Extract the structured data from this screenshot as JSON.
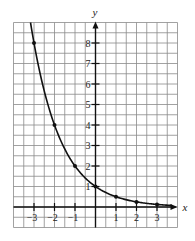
{
  "chart_data": {
    "type": "line",
    "title": "",
    "function": "y = (1/2)^x",
    "xlabel": "x",
    "ylabel": "y",
    "xlim": [
      -4,
      4
    ],
    "ylim": [
      -1,
      9
    ],
    "grid": true,
    "grid_step": 0.5,
    "x_ticks": [
      -3,
      -2,
      -1,
      1,
      2,
      3
    ],
    "x_tick_labels": [
      "-3",
      "-2",
      "-1",
      "1",
      "2",
      "3"
    ],
    "y_ticks": [
      1,
      2,
      3,
      4,
      5,
      6,
      7,
      8
    ],
    "y_tick_labels": [
      "1",
      "2",
      "3",
      "4",
      "5",
      "6",
      "7",
      "8"
    ],
    "points": [
      {
        "x": -3,
        "y": 8
      },
      {
        "x": -2,
        "y": 4
      },
      {
        "x": -1,
        "y": 2
      },
      {
        "x": 0,
        "y": 1
      },
      {
        "x": 1,
        "y": 0.5
      },
      {
        "x": 2,
        "y": 0.25
      },
      {
        "x": 3,
        "y": 0.125
      }
    ]
  },
  "layout": {
    "origin_px": [
      95.5,
      207
    ],
    "unit_px": 20.5,
    "grid_left": 13.5,
    "grid_right": 177.5,
    "grid_top": 22.5,
    "grid_bottom": 227.5
  }
}
